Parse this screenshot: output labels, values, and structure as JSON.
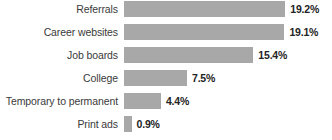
{
  "chart_data": {
    "type": "bar",
    "orientation": "horizontal",
    "title": "",
    "subtitle": "",
    "xlabel": "",
    "ylabel": "",
    "grid": false,
    "legend": false,
    "axis_visible": false,
    "xlim": [
      0,
      19.2
    ],
    "categories": [
      "Referrals",
      "Career websites",
      "Job boards",
      "College",
      "Temporary to permanent",
      "Print ads"
    ],
    "values": [
      19.2,
      19.1,
      15.4,
      7.5,
      4.4,
      0.9
    ],
    "value_labels": [
      "19.2%",
      "19.1%",
      "15.4%",
      "7.5%",
      "4.4%",
      "0.9%"
    ],
    "units": "percent",
    "bar_color": "#a8a8a8",
    "label_color": "#3a3a3a",
    "value_label_color": "#232323",
    "background_color": "#ffffff",
    "px_per_unit": 8.4
  }
}
